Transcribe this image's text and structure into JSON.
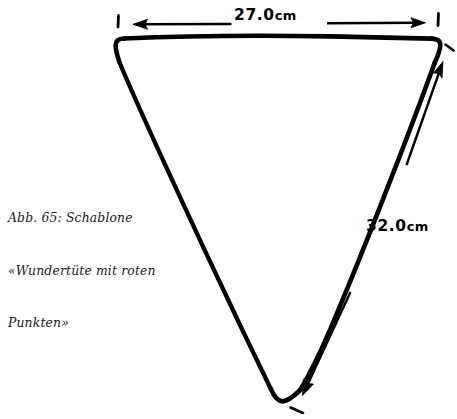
{
  "figure": {
    "background_color": "#ffffff",
    "ink_color": "#000000",
    "caption": {
      "lines": [
        "Abb. 65: Schablone",
        "«Wundertüte mit roten",
        "Punkten»"
      ],
      "full_text": "Abb. 65: Schablone «Wundertüte mit roten Punkten»",
      "figure_number": "Abb. 65:",
      "title": "Schablone «Wundertüte mit roten Punkten»"
    },
    "shape": {
      "name": "inverted-triangle-template",
      "description": "Hand-drawn inverted triangle (cone template) with rounded corners",
      "corners": {
        "top_left": "118,42",
        "top_right": "438,40",
        "bottom": "281,401"
      }
    },
    "dimensions": [
      {
        "id": "width",
        "value": "27.0",
        "unit": "cm",
        "label": "27.0cm",
        "edge": "top",
        "arrow": "double-headed-horizontal"
      },
      {
        "id": "side",
        "value": "32.0",
        "unit": "cm",
        "label": "32.0cm",
        "edge": "right-slant",
        "arrow": "double-headed-diagonal"
      }
    ],
    "tick_marks": [
      {
        "id": "tick-left",
        "position": "118,18"
      },
      {
        "id": "tick-right",
        "position": "438,16"
      }
    ]
  }
}
